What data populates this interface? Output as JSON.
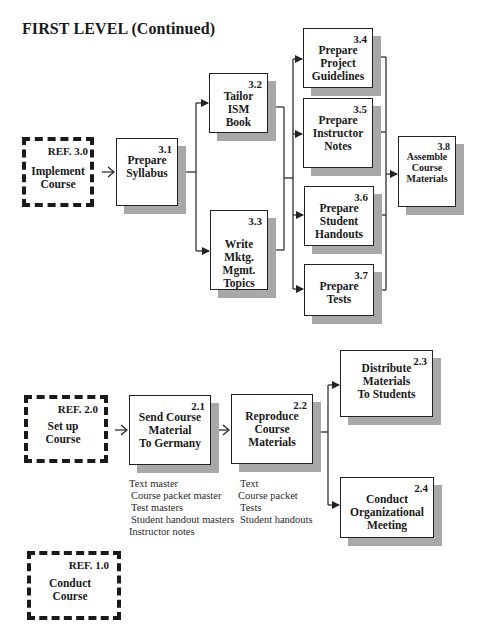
{
  "title": "FIRST LEVEL (Continued)",
  "top_section": {
    "ref": {
      "ref_label": "REF.   3.0",
      "label_lines": [
        "Implement",
        "Course"
      ]
    },
    "nodes": [
      {
        "id": "3.1",
        "lines": [
          "Prepare",
          "Syllabus"
        ]
      },
      {
        "id": "3.2",
        "lines": [
          "Tailor",
          "ISM",
          "Book"
        ]
      },
      {
        "id": "3.3",
        "lines": [
          "Write",
          "Mktg.",
          "Mgmt.",
          "Topics"
        ]
      },
      {
        "id": "3.4",
        "lines": [
          "Prepare",
          "Project",
          "Guidelines"
        ]
      },
      {
        "id": "3.5",
        "lines": [
          "Prepare",
          "Instructor",
          "Notes"
        ]
      },
      {
        "id": "3.6",
        "lines": [
          "Prepare",
          "Student",
          "Handouts"
        ]
      },
      {
        "id": "3.7",
        "lines": [
          "Prepare",
          "Tests"
        ]
      },
      {
        "id": "3.8",
        "lines": [
          "Assemble",
          "Course",
          "Materials"
        ]
      }
    ]
  },
  "bottom_section": {
    "ref": {
      "ref_label": "REF.   2.0",
      "label_lines": [
        "Set up",
        "Course"
      ]
    },
    "nodes": [
      {
        "id": "2.1",
        "lines": [
          "Send Course",
          "Material",
          "To Germany"
        ],
        "notes": [
          "Text master",
          "Course packet master",
          "Test masters",
          "Student handout masters",
          "Instructor notes"
        ]
      },
      {
        "id": "2.2",
        "lines": [
          "Reproduce",
          "Course",
          "Materials"
        ],
        "notes": [
          "Text",
          "Course packet",
          "Tests",
          "Student handouts"
        ]
      },
      {
        "id": "2.3",
        "lines": [
          "Distribute",
          "Materials",
          "To Students"
        ]
      },
      {
        "id": "2.4",
        "lines": [
          "Conduct",
          "Organizational",
          "Meeting"
        ]
      }
    ]
  },
  "final_ref": {
    "ref_label": "REF.   1.0",
    "label_lines": [
      "Conduct",
      "Course"
    ]
  },
  "colors": {
    "line": "#222222",
    "shadow": "#a8a8a8",
    "background": "#ffffff"
  }
}
